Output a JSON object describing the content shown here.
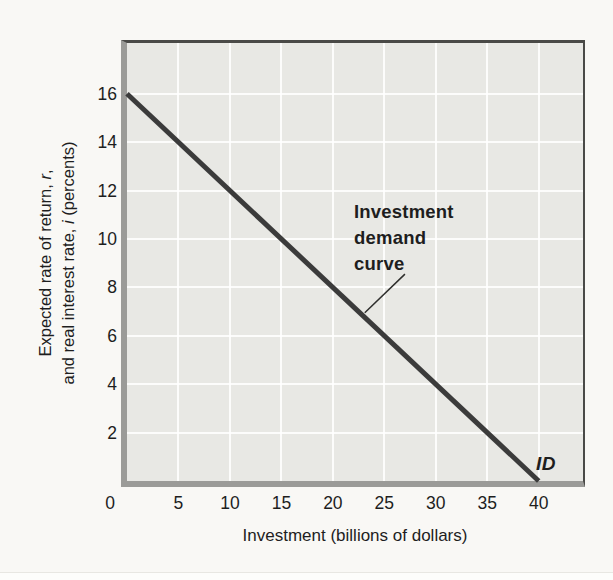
{
  "y_axis_label": {
    "line1_pre": "Expected rate of return, ",
    "line1_var": "r",
    "line1_post": ",",
    "line2_pre": "and real interest rate, ",
    "line2_var": "i",
    "line2_post": " (percents)"
  },
  "chart_data": {
    "type": "line",
    "title": "",
    "xlabel": "Investment (billions of dollars)",
    "ylabel": "Expected rate of return, r, and real interest rate, i (percents)",
    "xlim": [
      0,
      44.3
    ],
    "ylim": [
      0,
      18.1
    ],
    "x_ticks": [
      0,
      5,
      10,
      15,
      20,
      25,
      30,
      35,
      40
    ],
    "y_ticks": [
      2,
      4,
      6,
      8,
      10,
      12,
      14,
      16
    ],
    "grid": true,
    "legend_position": "none",
    "series": [
      {
        "name": "Investment demand curve (ID)",
        "points": [
          [
            0,
            16
          ],
          [
            40,
            0
          ]
        ]
      }
    ],
    "curve_label": "ID",
    "annotation": {
      "text": "Investment\ndemand\ncurve",
      "leader": {
        "x1": 27.0,
        "y1": 8.55,
        "x2": 23.1,
        "y2": 6.95
      }
    }
  },
  "colors": {
    "page_bg": "#f9f8f5",
    "plot_bg": "#e8e8e4",
    "gridline": "#ffffff",
    "axis_band": "#9b9b98",
    "frame_dark": "#4a4a47",
    "curve": "#3b3b3b",
    "text": "#1e1e1e"
  }
}
